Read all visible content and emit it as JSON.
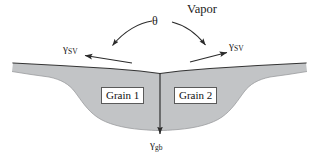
{
  "figure": {
    "name": "thermal-groove-grain-boundary-diagram",
    "background_color": "#ffffff",
    "solid_fill_color": "#c2c4c6",
    "outline_color": "#3a3a3a",
    "width": 319,
    "height": 163
  },
  "labels": {
    "vapor": "Vapor",
    "theta": "θ",
    "gamma_sv_left": {
      "symbol": "γ",
      "subscript": "SV"
    },
    "gamma_sv_right": {
      "symbol": "γ",
      "subscript": "SV"
    },
    "gamma_gb": {
      "symbol": "γ",
      "subscript": "gb"
    },
    "grain_1": "Grain 1",
    "grain_2": "Grain 2"
  },
  "annotations": {
    "angle_arc_name": "theta-contact-angle-arc",
    "gb_arrow_name": "grain-boundary-tension-arrow",
    "sv_left_arrow_name": "surface-tension-arrow-left",
    "sv_right_arrow_name": "surface-tension-arrow-right"
  }
}
